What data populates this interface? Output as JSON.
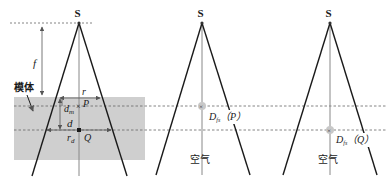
{
  "diagram": {
    "colors": {
      "beam_line": "#1a1a1a",
      "axis_line": "#888888",
      "phantom_fill": "#cfcfcf",
      "dashed_line": "#666666",
      "marker": "#9a9a9a"
    },
    "panels": [
      {
        "id": "phantom",
        "source_label": "S",
        "phantom_label": "模体",
        "distance_label": "f",
        "radius_label": "r",
        "depth_m_label": "d",
        "depth_m_sub": "m",
        "depth_label": "d",
        "radius_d_label": "r",
        "radius_d_sub": "d",
        "point_p_label": "P",
        "point_q_label": "Q"
      },
      {
        "id": "air-p",
        "source_label": "S",
        "measure_label": "D",
        "measure_sub": "fs",
        "point_label": "（P）",
        "medium_label": "空气"
      },
      {
        "id": "air-q",
        "source_label": "S",
        "measure_label": "D",
        "measure_sub": "fs",
        "point_label": "（Q）",
        "medium_label": "空气"
      }
    ]
  }
}
